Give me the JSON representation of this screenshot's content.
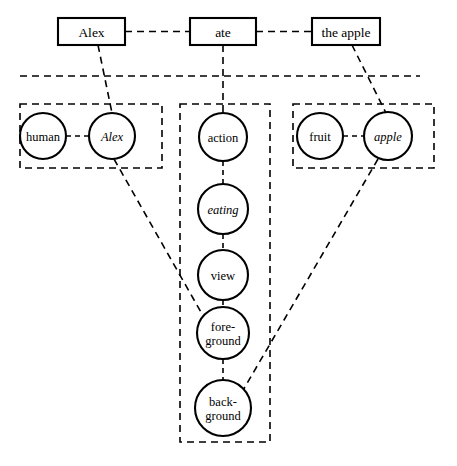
{
  "diagram": {
    "title": "Alex ate the apple",
    "type": "semantic-network-mapping",
    "background_color": "#ffffff",
    "stroke_color": "#000000",
    "surface_layer": {
      "name": "sentence-layer",
      "boxes": [
        {
          "id": "box-alex",
          "label": "Alex",
          "x": 58,
          "y": 18,
          "w": 67,
          "h": 27
        },
        {
          "id": "box-ate",
          "label": "ate",
          "x": 190,
          "y": 18,
          "w": 66,
          "h": 27
        },
        {
          "id": "box-the-apple",
          "label": "the apple",
          "x": 312,
          "y": 18,
          "w": 68,
          "h": 27
        }
      ],
      "box_links": [
        {
          "from": "box-alex",
          "to": "box-ate"
        },
        {
          "from": "box-ate",
          "to": "box-the-apple"
        }
      ]
    },
    "divider": {
      "name": "layer-divider",
      "x1": 20,
      "y1": 76,
      "x2": 420,
      "y2": 76
    },
    "groups": [
      {
        "id": "group-entity-human",
        "name": "left-concept-group",
        "x": 20,
        "y": 104,
        "w": 142,
        "h": 64,
        "nodes": [
          {
            "id": "node-human",
            "label": "human",
            "italic": false,
            "cx": 43,
            "cy": 136,
            "r": 23
          },
          {
            "id": "node-alex",
            "label": "Alex",
            "italic": true,
            "cx": 112,
            "cy": 136,
            "r": 23
          }
        ],
        "internal_links": [
          {
            "from": "node-human",
            "to": "node-alex"
          }
        ]
      },
      {
        "id": "group-action-chain",
        "name": "middle-concept-group",
        "x": 180,
        "y": 104,
        "w": 90,
        "h": 338,
        "nodes": [
          {
            "id": "node-action",
            "label": "action",
            "italic": false,
            "cx": 223,
            "cy": 137,
            "r": 24
          },
          {
            "id": "node-eating",
            "label": "eating",
            "italic": true,
            "cx": 223,
            "cy": 209,
            "r": 25
          },
          {
            "id": "node-view",
            "label": "view",
            "italic": false,
            "cx": 223,
            "cy": 275,
            "r": 25
          },
          {
            "id": "node-foreground",
            "label": "fore-ground",
            "line1": "fore-",
            "line2": "ground",
            "italic": false,
            "cx": 223,
            "cy": 333,
            "r": 26
          },
          {
            "id": "node-background",
            "label": "back-ground",
            "line1": "back-",
            "line2": "ground",
            "italic": false,
            "cx": 223,
            "cy": 408,
            "r": 28
          }
        ],
        "internal_links": [
          {
            "from": "node-action",
            "to": "node-eating"
          },
          {
            "from": "node-eating",
            "to": "node-view"
          },
          {
            "from": "node-view",
            "to": "node-foreground"
          },
          {
            "from": "node-foreground",
            "to": "node-background"
          }
        ]
      },
      {
        "id": "group-entity-fruit",
        "name": "right-concept-group",
        "x": 293,
        "y": 104,
        "w": 141,
        "h": 64,
        "nodes": [
          {
            "id": "node-fruit",
            "label": "fruit",
            "italic": false,
            "cx": 320,
            "cy": 136,
            "r": 23
          },
          {
            "id": "node-apple",
            "label": "apple",
            "italic": true,
            "cx": 388,
            "cy": 136,
            "r": 24
          }
        ],
        "internal_links": [
          {
            "from": "node-fruit",
            "to": "node-apple"
          }
        ]
      }
    ],
    "cross_links": [
      {
        "id": "link-box-alex-to-node-alex",
        "from": "box-alex",
        "to": "node-alex",
        "x1": 98,
        "y1": 45,
        "x2": 112,
        "y2": 113
      },
      {
        "id": "link-box-ate-to-node-action",
        "from": "box-ate",
        "to": "node-action",
        "x1": 223,
        "y1": 45,
        "x2": 223,
        "y2": 113
      },
      {
        "id": "link-box-apple-to-node-apple",
        "from": "box-the-apple",
        "to": "node-apple",
        "x1": 352,
        "y1": 45,
        "x2": 386,
        "y2": 113
      },
      {
        "id": "link-node-alex-to-foreground",
        "from": "node-alex",
        "to": "node-foreground",
        "x1": 114,
        "y1": 159,
        "x2": 206,
        "y2": 321
      },
      {
        "id": "link-node-apple-to-background",
        "from": "node-apple",
        "to": "node-background",
        "x1": 378,
        "y1": 159,
        "x2": 242,
        "y2": 392
      }
    ]
  }
}
